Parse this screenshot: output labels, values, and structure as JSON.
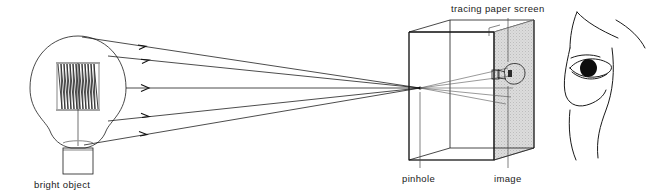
{
  "figure": {
    "background_color": "#ffffff",
    "ink_color": "#111111",
    "screen_fill_color": "#d9d9d9"
  },
  "labels": {
    "bright_object": "bright object",
    "tracing_paper_screen": "tracing paper screen",
    "pinhole": "pinhole",
    "image": "image"
  },
  "objects": {
    "lamp": {
      "name": "bright object",
      "parts": [
        "glass-bulb",
        "filament-coil",
        "filament-stem",
        "screw-base"
      ]
    },
    "box": {
      "name": "pinhole camera box",
      "parts": [
        "box-outline",
        "tracing-paper-screen-panel",
        "pinhole-aperture"
      ]
    },
    "projected_image": {
      "name": "inverted image of bulb",
      "orientation": "inverted"
    },
    "observer": {
      "name": "observer face in profile",
      "parts": [
        "face-profile",
        "eye",
        "eyebrow",
        "pupil"
      ]
    }
  },
  "rays": {
    "count_outgoing": 5,
    "direction": "left-to-right",
    "converge_at": "pinhole",
    "count_inside_box": 5,
    "arrowheads": true
  }
}
